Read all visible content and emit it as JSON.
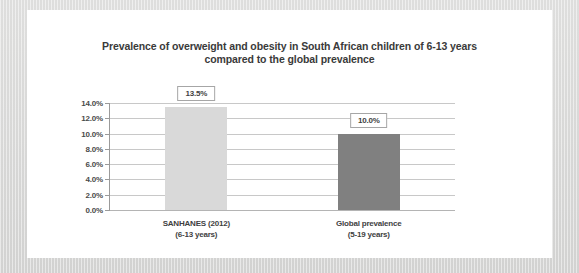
{
  "chart_data": {
    "type": "bar",
    "title": "Prevalence of overweight and obesity in South African children of 6-13 years compared to the global prevalence",
    "title_lines": [
      "Prevalence of overweight and obesity in South African children of 6-13 years",
      "compared to the global prevalence"
    ],
    "categories": [
      "SANHANES (2012)\n(6-13 years)",
      "Global prevalence\n(5-19 years)"
    ],
    "category_lines": [
      [
        "SANHANES (2012)",
        "(6-13 years)"
      ],
      [
        "Global prevalence",
        "(5-19 years)"
      ]
    ],
    "values": [
      13.5,
      10.0
    ],
    "data_labels": [
      "13.5%",
      "10.0%"
    ],
    "bar_colors": [
      "#d9d9d9",
      "#808080"
    ],
    "xlabel": "",
    "ylabel": "",
    "ylim": [
      0,
      14
    ],
    "ytick_values": [
      14.0,
      12.0,
      10.0,
      8.0,
      6.0,
      4.0,
      2.0,
      0.0
    ],
    "ytick_labels": [
      "14.0%",
      "12.0%",
      "10.0%",
      "8.0%",
      "6.0%",
      "4.0%",
      "2.0%",
      "0.0%"
    ],
    "grid": true,
    "legend": false,
    "gridline_color": "#c8c8c8",
    "axis_color": "#9a9a9a",
    "text_color": "#3a3a3a",
    "background": "#ffffff",
    "frame_color": "#dcdcdb"
  }
}
